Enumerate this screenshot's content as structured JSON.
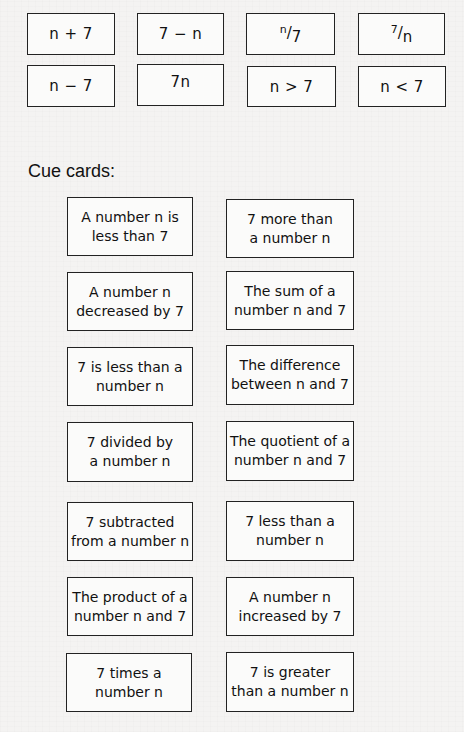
{
  "expression_cards": [
    {
      "label": "n + 7"
    },
    {
      "label": "7 − n"
    },
    {
      "numerator": "n",
      "denominator": "7",
      "label": "n/7"
    },
    {
      "numerator": "7",
      "denominator": "n",
      "label": "7/n"
    },
    {
      "label": "n − 7"
    },
    {
      "label": "7n"
    },
    {
      "label": "n > 7"
    },
    {
      "label": "n < 7"
    }
  ],
  "cue_section": {
    "title": "Cue cards:"
  },
  "cue_cards": [
    {
      "line1": "A number n is",
      "line2": "less than 7"
    },
    {
      "line1": "7 more than",
      "line2": "a number n"
    },
    {
      "line1": "A number n",
      "line2": "decreased by 7"
    },
    {
      "line1": "The sum of a",
      "line2": "number n and 7"
    },
    {
      "line1": "7 is less than a",
      "line2": "number n"
    },
    {
      "line1": "The difference",
      "line2": "between n and 7"
    },
    {
      "line1": "7 divided by",
      "line2": "a number n"
    },
    {
      "line1": "The quotient of a",
      "line2": "number n and 7"
    },
    {
      "line1": "7 subtracted",
      "line2": "from a number n"
    },
    {
      "line1": "7 less than a",
      "line2": "number n"
    },
    {
      "line1": "The product of a",
      "line2": "number n and 7"
    },
    {
      "line1": "A number n",
      "line2": "increased by 7"
    },
    {
      "line1": "7 times a",
      "line2": "number n"
    },
    {
      "line1": "7 is greater",
      "line2": "than a number n"
    }
  ]
}
